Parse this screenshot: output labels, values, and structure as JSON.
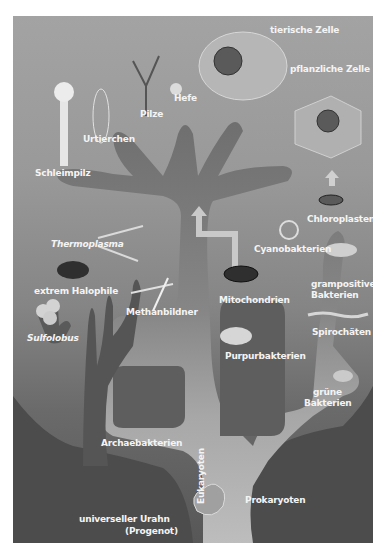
{
  "diagram": {
    "type": "phylogenetic-tree",
    "language": "de",
    "colors": {
      "frame_top": "#a3a3a3",
      "frame_bottom": "#575757",
      "label": "#f4f4f4",
      "trunk_light": "#b4b4b4",
      "trunk_dark": "#6e6e6e"
    },
    "root": {
      "label": "universeller Urahn",
      "sublabel": "(Progenot)"
    },
    "domains": {
      "archaea": "Archaebakterien",
      "eukaryotes": "Eukaryoten",
      "prokaryotes": "Prokaryoten"
    },
    "eukaryote_labels": [
      "tierische Zelle",
      "pflanzliche Zelle",
      "Hefe",
      "Pilze",
      "Urtierchen",
      "Schleimpilz"
    ],
    "archaea_labels": [
      "Thermoplasma",
      "extrem Halophile",
      "Methanbildner",
      "Sulfolobus"
    ],
    "bacteria_labels": [
      "Chloroplasten",
      "Cyanobakterien",
      "grampositive",
      "Bakterien",
      "Mitochondrien",
      "Purpurbakterien",
      "Spirochäten",
      "grüne",
      "Bakterien"
    ]
  }
}
